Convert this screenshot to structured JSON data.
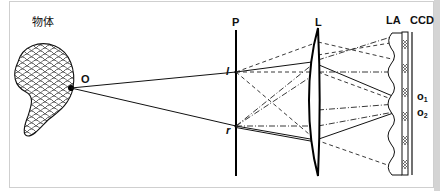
{
  "diagram": {
    "type": "optical-setup",
    "labels": {
      "object": "物体",
      "point_o": "O",
      "plane": "P",
      "point_l": "l",
      "point_r": "r",
      "lens": "L",
      "lenslet_array": "LA",
      "sensor": "CCD",
      "image_o1_main": "o",
      "image_o1_sub": "1",
      "image_o2_main": "o",
      "image_o2_sub": "2"
    },
    "components": [
      {
        "id": "object",
        "label": "物体",
        "shape": "cross-hatched blob"
      },
      {
        "id": "P",
        "label": "P",
        "shape": "vertical line (aperture plane)"
      },
      {
        "id": "L",
        "label": "L",
        "shape": "convex lens"
      },
      {
        "id": "LA",
        "label": "LA",
        "shape": "lenslet array (wavy profile)"
      },
      {
        "id": "CCD",
        "label": "CCD",
        "shape": "sensor strip with hatched pixels"
      }
    ],
    "rays": [
      {
        "from": "O",
        "to": "l",
        "style": "solid"
      },
      {
        "from": "O",
        "to": "r",
        "style": "solid"
      },
      {
        "from": "l",
        "to": "o1",
        "style": "solid",
        "via": "L"
      },
      {
        "from": "r",
        "to": "o2",
        "style": "solid",
        "via": "L"
      },
      {
        "from": "l",
        "style": "dashed",
        "note": "cross rays to LA"
      },
      {
        "from": "r",
        "style": "dash-dot",
        "note": "cross rays to LA"
      }
    ],
    "colors": {
      "ink": "#111111",
      "frame": "#cfcfcf",
      "background": "#ffffff"
    }
  }
}
